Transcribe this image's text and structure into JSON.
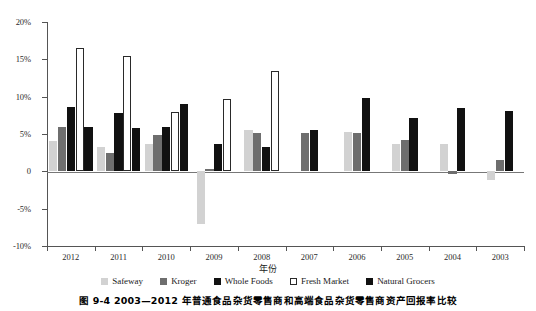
{
  "caption": "图 9-4   2003—2012 年普通食品杂货零售商和高端食品杂货零售商资产回报率比较",
  "axes": {
    "x_title": "年份",
    "y_ticks": [
      "20%",
      "15%",
      "10%",
      "5%",
      "0",
      "-5%",
      "-10%"
    ]
  },
  "legend": [
    {
      "label": "Safeway",
      "color": "#d2d2d2",
      "swatch": "filled-light-gray"
    },
    {
      "label": "Kroger",
      "color": "#6e6e6e",
      "swatch": "filled-mid-gray"
    },
    {
      "label": "Whole Foods",
      "color": "#111111",
      "swatch": "filled-black"
    },
    {
      "label": "Fresh Market",
      "color": "#ffffff",
      "swatch": "hollow-outline"
    },
    {
      "label": "Natural Grocers",
      "color": "#111111",
      "swatch": "filled-black"
    }
  ],
  "chart_data": {
    "type": "bar",
    "title": "",
    "xlabel": "年份",
    "ylabel": "",
    "ylim": [
      -10,
      20
    ],
    "ytick_step": 5,
    "grid": false,
    "legend_position": "bottom",
    "categories": [
      "2012",
      "2011",
      "2010",
      "2009",
      "2008",
      "2007",
      "2006",
      "2005",
      "2004",
      "2003"
    ],
    "series": [
      {
        "name": "Safeway",
        "color": "#d2d2d2",
        "values": [
          4.0,
          3.2,
          3.7,
          -7.0,
          5.5,
          null,
          5.3,
          3.6,
          3.6,
          -1.2
        ]
      },
      {
        "name": "Kroger",
        "color": "#6e6e6e",
        "values": [
          6.0,
          2.5,
          4.9,
          0.3,
          5.1,
          5.2,
          5.2,
          4.2,
          -0.4,
          1.5
        ]
      },
      {
        "name": "Whole Foods",
        "color": "#111111",
        "values": [
          8.6,
          7.8,
          6.0,
          3.7,
          3.2,
          null,
          null,
          null,
          null,
          null
        ]
      },
      {
        "name": "Fresh Market",
        "color": "#ffffff",
        "values": [
          16.5,
          15.5,
          8.0,
          9.7,
          13.5,
          null,
          null,
          null,
          null,
          null
        ]
      },
      {
        "name": "Natural Grocers",
        "color": "#111111",
        "values": [
          6.0,
          5.8,
          9.0,
          null,
          null,
          5.5,
          9.8,
          7.1,
          8.5,
          8.1
        ]
      }
    ]
  }
}
